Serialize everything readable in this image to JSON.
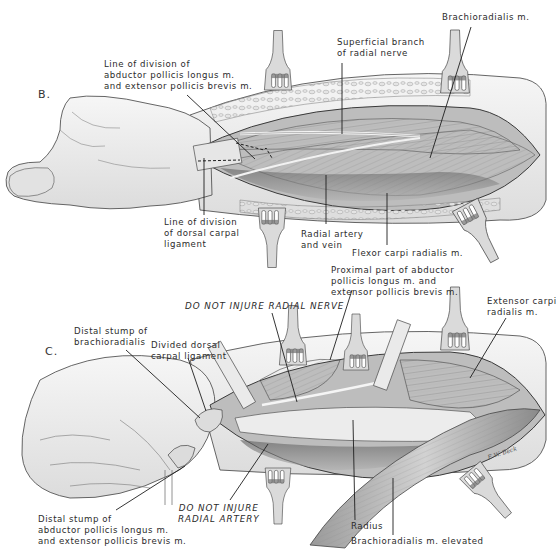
{
  "figure": {
    "type": "surgical anatomical illustration",
    "signature": "E.W. Beck"
  },
  "panels": [
    {
      "letter": "B.",
      "labels": {
        "line_division_apl_epb": [
          "Line of division of",
          "abductor pollicis longus m.",
          "and extensor pollicis brevis m."
        ],
        "superficial_branch": [
          "Superficial branch",
          "of radial nerve"
        ],
        "brachioradialis": [
          "Brachioradialis m."
        ],
        "line_division_dorsal_carpal": [
          "Line of division",
          "of dorsal carpal",
          "ligament"
        ],
        "radial_artery_vein": [
          "Radial artery",
          "and vein"
        ],
        "flexor_carpi_radialis": [
          "Flexor carpi radialis m."
        ]
      }
    },
    {
      "letter": "C.",
      "labels": {
        "proximal_part": [
          "Proximal part of abductor",
          "pollicis longus m. and",
          "extensor pollicis brevis m."
        ],
        "do_not_injure_nerve": [
          "DO NOT INJURE RADIAL NERVE"
        ],
        "extensor_carpi_radialis": [
          "Extensor carpi",
          "radialis m."
        ],
        "distal_stump_brachioradialis": [
          "Distal stump of",
          "brachioradialis"
        ],
        "divided_dorsal_carpal": [
          "Divided dorsal",
          "carpal ligament"
        ],
        "distal_stump_apl_epb": [
          "Distal stump of",
          "abductor pollicis longus m.",
          "and extensor pollicis brevis m."
        ],
        "do_not_injure_artery": [
          "DO NOT INJURE",
          "RADIAL ARTERY"
        ],
        "radius": [
          "Radius"
        ],
        "brachioradialis_elevated": [
          "Brachioradialis m. elevated"
        ]
      }
    }
  ],
  "colors": {
    "outline": "#3a3a3a",
    "skin": "#eeeeee",
    "muscle": "#c9c9c9",
    "muscle_dark": "#6a6a6a",
    "retractor": "#d6d6d6",
    "leader": "#1e1e1e"
  }
}
